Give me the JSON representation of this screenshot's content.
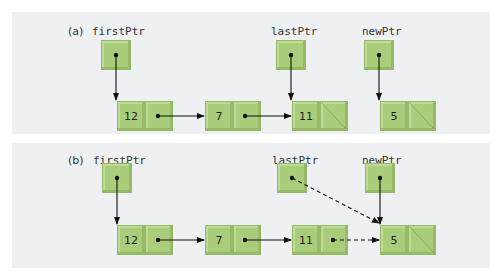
{
  "colors": {
    "panel_bg": "#eef0f1",
    "node_fill": "#a9cd7a",
    "node_border": "#93b866",
    "arrow": "#111111"
  },
  "panels": [
    {
      "label": "(a)",
      "pointers": [
        {
          "name": "firstPtr",
          "target": "12"
        },
        {
          "name": "lastPtr",
          "target": "11"
        },
        {
          "name": "newPtr",
          "target": "5"
        }
      ],
      "nodes": [
        {
          "value": "12",
          "next": "7"
        },
        {
          "value": "7",
          "next": "11"
        },
        {
          "value": "11",
          "next": null
        },
        {
          "value": "5",
          "next": null
        }
      ]
    },
    {
      "label": "(b)",
      "pointers": [
        {
          "name": "firstPtr",
          "target": "12"
        },
        {
          "name": "lastPtr",
          "target": "5",
          "style": "dashed"
        },
        {
          "name": "newPtr",
          "target": "5"
        }
      ],
      "nodes": [
        {
          "value": "12",
          "next": "7"
        },
        {
          "value": "7",
          "next": "11"
        },
        {
          "value": "11",
          "next": "5",
          "style": "dashed"
        },
        {
          "value": "5",
          "next": null
        }
      ]
    }
  ]
}
